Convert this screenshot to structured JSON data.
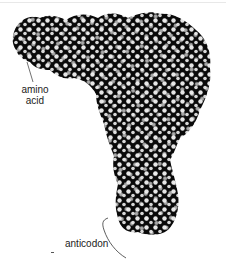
{
  "figure": {
    "labels": {
      "amino_acid_line1": "amino",
      "amino_acid_line2": "acid",
      "anticodon": "anticodon"
    },
    "colors": {
      "molecule_dark": "#0a0a0a",
      "atom_highlight": "#e8e8e8",
      "background": "#ffffff",
      "leader_line": "#333333"
    }
  }
}
